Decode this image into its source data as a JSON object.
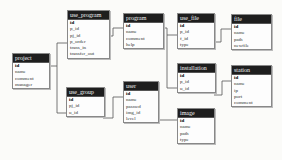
{
  "diagram": {
    "type": "entity-relationship",
    "tables": [
      {
        "name": "project",
        "fields": [
          "id",
          "name",
          "comment",
          "manager"
        ]
      },
      {
        "name": "use_program",
        "fields": [
          "id",
          "p_id",
          "pj_id",
          "p_order",
          "trans_in",
          "transfer_out"
        ]
      },
      {
        "name": "program",
        "fields": [
          "id",
          "name",
          "comment",
          "help"
        ]
      },
      {
        "name": "use_file",
        "fields": [
          "id",
          "p_id",
          "f_id",
          "type"
        ]
      },
      {
        "name": "file",
        "fields": [
          "id",
          "name",
          "path",
          "newfile"
        ]
      },
      {
        "name": "use_group",
        "fields": [
          "id",
          "pj_id",
          "u_id"
        ]
      },
      {
        "name": "user",
        "fields": [
          "id",
          "name",
          "passwd",
          "img_id",
          "level"
        ]
      },
      {
        "name": "installation",
        "fields": [
          "id",
          "p_id",
          "u_id"
        ]
      },
      {
        "name": "image",
        "fields": [
          "id",
          "name",
          "path",
          "type"
        ]
      },
      {
        "name": "station",
        "fields": [
          "id",
          "name",
          "ip",
          "port",
          "comment"
        ]
      }
    ],
    "relationships": [
      {
        "from": "project",
        "to": "use_program"
      },
      {
        "from": "project",
        "to": "use_group"
      },
      {
        "from": "use_program",
        "to": "program"
      },
      {
        "from": "program",
        "to": "use_file"
      },
      {
        "from": "program",
        "to": "installation"
      },
      {
        "from": "use_file",
        "to": "file"
      },
      {
        "from": "use_group",
        "to": "user"
      },
      {
        "from": "user",
        "to": "image"
      },
      {
        "from": "installation",
        "to": "station"
      }
    ],
    "colors": {
      "header_bg": "#1e1e1e",
      "header_text": "#f2f2f2",
      "border": "#888888",
      "line": "#555555"
    }
  }
}
